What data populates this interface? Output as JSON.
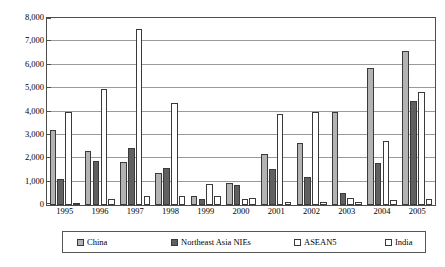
{
  "chart_data": {
    "type": "bar",
    "title": "",
    "xlabel": "",
    "ylabel": "",
    "ylim": [
      0,
      8000
    ],
    "ytick_labels": [
      "8,000",
      "7,000",
      "6,000",
      "5,000",
      "4,000",
      "3,000",
      "2,000",
      "1,000",
      "0"
    ],
    "ytick_values": [
      8000,
      7000,
      6000,
      5000,
      4000,
      3000,
      2000,
      1000,
      0
    ],
    "grid": true,
    "legend_position": "bottom",
    "categories": [
      "1995",
      "1996",
      "1997",
      "1998",
      "1999",
      "2000",
      "2001",
      "2002",
      "2003",
      "2004",
      "2005"
    ],
    "series": [
      {
        "name": "China",
        "color": "#b3b3b3",
        "values": [
          3200,
          2320,
          1850,
          1350,
          400,
          950,
          2200,
          2650,
          4000,
          5850,
          6600
        ]
      },
      {
        "name": "Northeast Asia NIEs",
        "color": "#606060",
        "values": [
          1120,
          1900,
          2450,
          1600,
          250,
          850,
          1550,
          1200,
          500,
          1800,
          4450
        ]
      },
      {
        "name": "ASEAN5",
        "color": "#ffffff",
        "values": [
          4000,
          4980,
          7550,
          4350,
          900,
          250,
          3900,
          4000,
          300,
          2750,
          4850
        ]
      },
      {
        "name": "India",
        "color": "#ffffff",
        "values": [
          60,
          250,
          400,
          400,
          400,
          300,
          150,
          150,
          150,
          200,
          250
        ]
      }
    ]
  },
  "legend": {
    "items": [
      {
        "label": "China",
        "swatch": "legend-swatch-china"
      },
      {
        "label": "Northeast Asia NIEs",
        "swatch": "legend-swatch-nies"
      },
      {
        "label": "ASEAN5",
        "swatch": "legend-swatch-asean5"
      },
      {
        "label": "India",
        "swatch": "legend-swatch-india"
      }
    ]
  }
}
